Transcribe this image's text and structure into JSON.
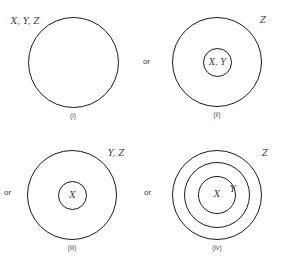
{
  "figure": {
    "background_color": "#ffffff",
    "stroke_color": "#1a1a1a",
    "label_color": "#333333",
    "caption_color": "#4a4a4a"
  },
  "connectors": {
    "or_1": "or",
    "or_2": "or",
    "or_3": "or"
  },
  "panels": [
    {
      "id": "i",
      "caption": "(i)",
      "circle_count": 1,
      "outer_label": "X, Y, Z",
      "inner_label": "",
      "middle_label": ""
    },
    {
      "id": "ii",
      "caption": "(ii)",
      "circle_count": 2,
      "outer_label": "Z",
      "inner_label": "X, Y",
      "middle_label": ""
    },
    {
      "id": "iii",
      "caption": "(iii)",
      "circle_count": 2,
      "outer_label": "Y, Z",
      "inner_label": "X",
      "middle_label": ""
    },
    {
      "id": "iv",
      "caption": "(iv)",
      "circle_count": 3,
      "outer_label": "Z",
      "middle_label": "Y",
      "inner_label": "X"
    }
  ]
}
